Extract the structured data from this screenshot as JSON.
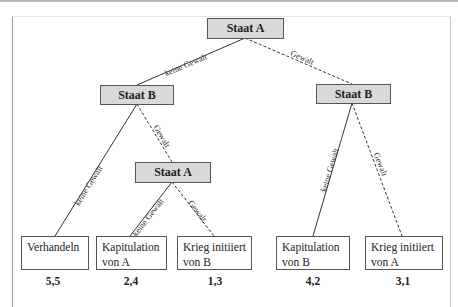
{
  "nodes": {
    "root": "Staat A",
    "left_b": "Staat B",
    "right_b": "Staat B",
    "mid_a": "Staat A"
  },
  "edges": {
    "root_left": "keine Gewalt",
    "root_right": "Gewalt",
    "leftb_left": "keine Gewalt",
    "leftb_right": "Gewalt",
    "mida_left": "keine Gewalt",
    "mida_right": "Gewalt",
    "rightb_left": "keine Gewalt",
    "rightb_right": "Gewalt"
  },
  "outcomes": [
    {
      "line1": "Verhandeln",
      "line2": "",
      "payoff": "5,5"
    },
    {
      "line1": "Kapitulation",
      "line2": "von A",
      "payoff": "2,4"
    },
    {
      "line1": "Krieg initiiert",
      "line2": "von B",
      "payoff": "1,3"
    },
    {
      "line1": "Kapitulation",
      "line2": "von B",
      "payoff": "4,2"
    },
    {
      "line1": "Krieg initiiert",
      "line2": "von A",
      "payoff": "3,1"
    }
  ],
  "colors": {
    "node_fill": "#d9d9d9",
    "line": "#333333"
  }
}
